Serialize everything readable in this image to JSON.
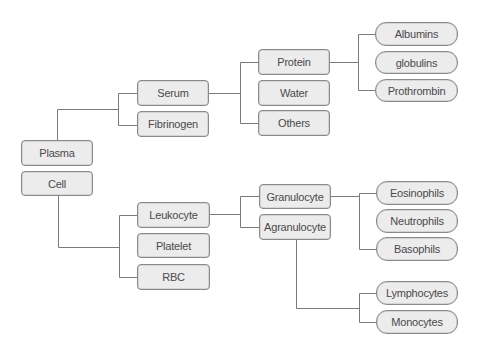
{
  "diagram": {
    "title": "",
    "root_nodes": {
      "plasma": "Plasma",
      "cell": "Cell"
    },
    "plasma_children": {
      "serum": "Serum",
      "fibrinogen": "Fibrinogen"
    },
    "serum_children": {
      "protein": "Protein",
      "water": "Water",
      "others": "Others"
    },
    "protein_children": {
      "albumins": "Albumins",
      "globulins": "globulins",
      "prothrombin": "Prothrombin"
    },
    "cell_children": {
      "leukocyte": "Leukocyte",
      "platelet": "Platelet",
      "rbc": "RBC"
    },
    "leukocyte_children": {
      "granulocyte": "Granulocyte",
      "agranulocyte": "Agranulocyte"
    },
    "granulocyte_children": {
      "eosinophils": "Eosinophils",
      "neutrophils": "Neutrophils",
      "basophils": "Basophils"
    },
    "agranulocyte_children": {
      "lymphocytes": "Lymphocytes",
      "monocytes": "Monocytes"
    },
    "colors": {
      "node_fill": "#ececec",
      "node_border": "#8a8a8a",
      "connector": "#7a7a7a",
      "text": "#4a4a4a"
    }
  }
}
